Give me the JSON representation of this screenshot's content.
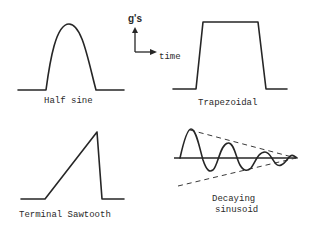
{
  "diagram": {
    "axis": {
      "y_label": "g's",
      "x_label": "time"
    },
    "pulses": [
      {
        "id": "half-sine",
        "label": "Half sine"
      },
      {
        "id": "trapezoidal",
        "label": "Trapezoidal"
      },
      {
        "id": "terminal-sawtooth",
        "label": "Terminal Sawtooth"
      },
      {
        "id": "decaying-sinusoid",
        "label_line1": "Decaying",
        "label_line2": "sinusoid"
      }
    ],
    "colors": {
      "ink": "#262626",
      "background": "#ffffff"
    }
  }
}
